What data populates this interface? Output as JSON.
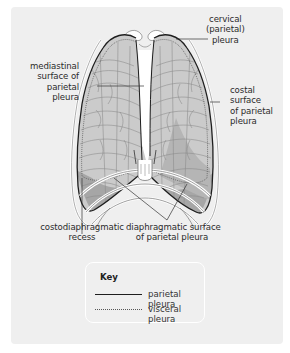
{
  "figure": {
    "type": "anatomical diagram",
    "panel_color": "#efefef",
    "lung_fill": "#c9c9c9",
    "recess_fill": "#a9a9a9"
  },
  "labels": {
    "cervical": [
      "cervical",
      "(parietal)",
      "pleura"
    ],
    "mediastinal": [
      "mediastinal",
      "surface of",
      "parietal",
      "pleura"
    ],
    "costal": [
      "costal",
      "surface",
      "of parietal",
      "pleura"
    ],
    "costodiaphragmatic": [
      "costodiaphragmatic",
      "recess"
    ],
    "diaphragmatic": [
      "diaphragmatic surface",
      "of parietal pleura"
    ]
  },
  "key": {
    "title": "Key",
    "items": [
      {
        "line": "solid",
        "label": "parietal pleura"
      },
      {
        "line": "dotted",
        "label": "visceral pleura"
      }
    ]
  }
}
